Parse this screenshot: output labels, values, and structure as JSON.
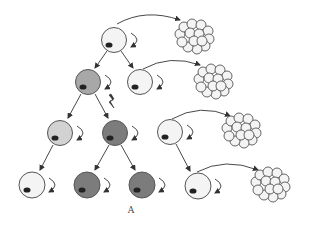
{
  "caption": "A",
  "colors": {
    "white": "#f4f4f4",
    "light_gray": "#d2d2d2",
    "mid_gray": "#a8a8a8",
    "dark_gray": "#7c7c7c",
    "nucleus": "#222222",
    "outline": "#555555",
    "arrow": "#333333"
  },
  "cells": [
    {
      "id": "stem-top",
      "row": 1,
      "x": 114,
      "y": 40,
      "shade": "white"
    },
    {
      "id": "progenitor-gray",
      "row": 2,
      "x": 88,
      "y": 82,
      "shade": "mid_gray"
    },
    {
      "id": "stem-r2",
      "row": 2,
      "x": 140,
      "y": 82,
      "shade": "white"
    },
    {
      "id": "progeny-light",
      "row": 3,
      "x": 60,
      "y": 133,
      "shade": "light_gray"
    },
    {
      "id": "mutant-dark",
      "row": 3,
      "x": 115,
      "y": 133,
      "shade": "dark_gray"
    },
    {
      "id": "stem-r3",
      "row": 3,
      "x": 170,
      "y": 132,
      "shade": "white"
    },
    {
      "id": "progeny-white",
      "row": 4,
      "x": 32,
      "y": 185,
      "shade": "white"
    },
    {
      "id": "mutant-dark-a",
      "row": 4,
      "x": 87,
      "y": 185,
      "shade": "dark_gray"
    },
    {
      "id": "mutant-dark-b",
      "row": 4,
      "x": 142,
      "y": 185,
      "shade": "dark_gray"
    },
    {
      "id": "stem-r4",
      "row": 4,
      "x": 198,
      "y": 186,
      "shade": "white"
    }
  ],
  "clusters": [
    {
      "id": "colony-1",
      "x": 194,
      "y": 36
    },
    {
      "id": "colony-2",
      "x": 213,
      "y": 81
    },
    {
      "id": "colony-3",
      "x": 241,
      "y": 130
    },
    {
      "id": "colony-4",
      "x": 270,
      "y": 184
    }
  ],
  "mutation_marker": {
    "x": 112,
    "y": 103,
    "label": "lightning-bolt"
  }
}
